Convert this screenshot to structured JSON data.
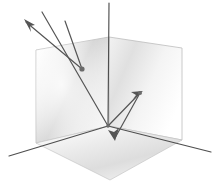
{
  "figure": {
    "width": 217,
    "height": 184,
    "background_color": "#ffffff"
  },
  "palette": {
    "line_color": "#555555",
    "axis_color": "#4e4e4e",
    "plane_edge_color": "#b9b9b9",
    "plane_light": "#ffffff",
    "plane_mid": "#e2e2e2",
    "plane_dark": "#c4c4c4",
    "plane_floor_light": "#fbfbfb",
    "plane_floor_dark": "#d8d8d8",
    "arrow_color": "#555555",
    "vertex_color": "#6a6a6a"
  },
  "geometry": {
    "origin": {
      "x": 108,
      "y": 126
    },
    "top_corner": {
      "x": 109,
      "y": 37
    },
    "vertical_axis_top": {
      "x": 109,
      "y": 3
    },
    "left_axis_end": {
      "x": 9,
      "y": 156
    },
    "right_axis_end": {
      "x": 211,
      "y": 152
    },
    "left_plane_outer_top": {
      "x": 36,
      "y": 50
    },
    "left_plane_outer_bottom": {
      "x": 36,
      "y": 143
    },
    "right_plane_outer_top": {
      "x": 182,
      "y": 48
    },
    "right_plane_outer_bottom": {
      "x": 182,
      "y": 140
    },
    "floor_left": {
      "x": 36,
      "y": 143
    },
    "floor_right": {
      "x": 182,
      "y": 140
    },
    "floor_front": {
      "x": 110,
      "y": 180
    }
  },
  "planes": [
    {
      "name": "left-vertical-plane",
      "points": "36,50 109,37 109,126 36,143",
      "gradient": "grad-left-plane"
    },
    {
      "name": "right-vertical-plane",
      "points": "109,37 182,48 182,140 109,126",
      "gradient": "grad-right-plane"
    },
    {
      "name": "floor-plane",
      "points": "36,143 109,126 182,140 110,180",
      "gradient": "grad-floor-plane"
    }
  ],
  "axes": [
    {
      "name": "vertical-axis",
      "from": {
        "x": 109,
        "y": 3
      },
      "to": {
        "x": 108,
        "y": 126
      },
      "label": "vertical axis"
    },
    {
      "name": "left-horizontal-axis",
      "from": {
        "x": 108,
        "y": 126
      },
      "to": {
        "x": 9,
        "y": 156
      },
      "label": "left horizontal axis"
    },
    {
      "name": "right-horizontal-axis",
      "from": {
        "x": 108,
        "y": 126
      },
      "to": {
        "x": 211,
        "y": 152
      },
      "label": "right horizontal axis"
    }
  ],
  "rays": [
    {
      "name": "incident-ray",
      "label": "incident ray entering from upper left",
      "points": "42,12 108,126",
      "has_arrowhead": false
    },
    {
      "name": "reflected-ray-to-wall",
      "label": "ray reflecting off left plane toward upper left exit",
      "points": "82,69 26,22",
      "has_arrowhead": true,
      "arrow_at": {
        "x": 26,
        "y": 22
      },
      "arrow_direction": "up-left"
    },
    {
      "name": "wall-incoming-segment",
      "label": "segment arriving at left plane reflection vertex",
      "points": "65,21 82,69",
      "has_arrowhead": false
    },
    {
      "name": "ray-origin-to-right-vertex",
      "label": "ray travelling from corner origin up to right plane vertex",
      "points": "108,126 140,93",
      "has_arrowhead": true,
      "arrow_at": {
        "x": 140,
        "y": 93
      },
      "arrow_direction": "up-right"
    },
    {
      "name": "ray-right-vertex-to-floor",
      "label": "ray descending from right plane vertex to the floor",
      "points": "140,93 115,138",
      "has_arrowhead": true,
      "arrow_at": {
        "x": 115,
        "y": 138
      },
      "arrow_direction": "down-left"
    }
  ],
  "vertices": [
    {
      "name": "left-plane-reflection-vertex",
      "x": 82,
      "y": 69,
      "radius": 2.6
    },
    {
      "name": "right-plane-reflection-vertex",
      "x": 140,
      "y": 93,
      "radius": 2.0
    },
    {
      "name": "corner-origin-vertex",
      "x": 108,
      "y": 126,
      "radius": 1.8
    }
  ]
}
